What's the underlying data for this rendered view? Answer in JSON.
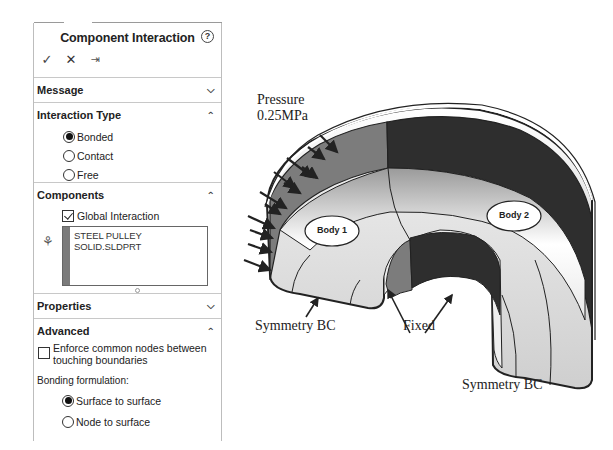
{
  "panel": {
    "title": "Component Interaction",
    "help_icon": "?",
    "toolbar": {
      "ok_glyph": "✓",
      "cancel_glyph": "✕",
      "pin_glyph": "⇥"
    },
    "sections": {
      "message": {
        "label": "Message",
        "state": "collapsed",
        "chevron": "⌄"
      },
      "interaction_type": {
        "label": "Interaction Type",
        "state": "expanded",
        "chevron": "⌃",
        "options": [
          {
            "label": "Bonded",
            "selected": true
          },
          {
            "label": "Contact",
            "selected": false
          },
          {
            "label": "Free",
            "selected": false
          }
        ]
      },
      "components": {
        "label": "Components",
        "state": "expanded",
        "chevron": "⌃",
        "global_interaction": {
          "label": "Global Interaction",
          "checked": true
        },
        "list_items": [
          "STEEL PULLEY SOLID.SLDPRT"
        ],
        "list_color": "#7b7b7b"
      },
      "properties": {
        "label": "Properties",
        "state": "collapsed",
        "chevron": "⌄"
      },
      "advanced": {
        "label": "Advanced",
        "state": "expanded",
        "chevron": "⌃",
        "enforce_common_nodes": {
          "label": "Enforce common nodes between touching boundaries",
          "line1": "Enforce common nodes between",
          "line2": "touching boundaries",
          "checked": false
        },
        "bonding_formulation_label": "Bonding formulation:",
        "bonding_options": [
          {
            "label": "Surface to surface",
            "selected": true
          },
          {
            "label": "Node to surface",
            "selected": false
          }
        ]
      }
    }
  },
  "figure": {
    "annotations": {
      "pressure_line1": "Pressure",
      "pressure_line2": "0.25MPa",
      "symmetry_left": "Symmetry BC",
      "fixed": "Fixed",
      "symmetry_right": "Symmetry BC"
    },
    "bodies": [
      {
        "label": "Body 1"
      },
      {
        "label": "Body 2"
      }
    ],
    "colors": {
      "body1_face": "#7c7c7c",
      "body2_face": "#2e2e2e",
      "surface_light": "#d8d8d8",
      "arrow": "#222222"
    }
  }
}
